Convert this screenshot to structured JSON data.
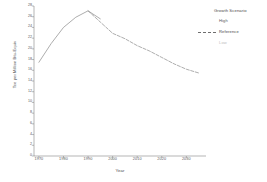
{
  "chart_data": {
    "type": "line",
    "title": "",
    "xlabel": "Year",
    "ylabel": "Tce per Million Btu-Equiv",
    "xlim": [
      1968,
      2038
    ],
    "ylim": [
      0,
      28
    ],
    "grid": false,
    "legend_position": "right",
    "legend_title": "Growth Scenario",
    "x_ticks": [
      1970,
      1980,
      1990,
      2000,
      2010,
      2020,
      2030
    ],
    "x_tick_labels": [
      "1970",
      "1980",
      "1990",
      "2000",
      "2010",
      "2020",
      "2030"
    ],
    "y_ticks": [
      0,
      2,
      4,
      6,
      8,
      10,
      12,
      14,
      16,
      18,
      20,
      22,
      24,
      26,
      28
    ],
    "y_tick_labels": [
      "0",
      "2",
      "4",
      "6",
      "8",
      "10",
      "12",
      "14",
      "16",
      "18",
      "20",
      "22",
      "24",
      "26",
      "28"
    ],
    "series": [
      {
        "name": "High",
        "style": "solid",
        "color": "#808080",
        "x": [
          1970,
          1975,
          1980,
          1985,
          1990,
          1995
        ],
        "values": [
          17.5,
          21.0,
          24.0,
          25.9,
          27.1,
          25.6
        ]
      },
      {
        "name": "Reference",
        "style": "dashed",
        "color": "#808080",
        "x": [
          1990,
          1995,
          2000,
          2005,
          2010,
          2015,
          2020,
          2025,
          2030,
          2035
        ],
        "values": [
          27.1,
          25.0,
          22.9,
          21.9,
          20.6,
          19.6,
          18.4,
          17.2,
          16.2,
          15.5
        ]
      },
      {
        "name": "Low",
        "style": "dotted",
        "color": "#c9c9c9",
        "x": [],
        "values": []
      }
    ]
  },
  "legend": {
    "title": "Growth Scenario",
    "entries": [
      {
        "label": "High",
        "color": "#5a5a5a",
        "sample": "none"
      },
      {
        "label": "Reference",
        "color": "#4a4a4a",
        "sample": "dashed"
      },
      {
        "label": "Low",
        "color": "#c0c0c0",
        "sample": "none"
      }
    ]
  },
  "axes": {
    "x_title": "Year",
    "y_title": "Tce per Million Btu-Equiv"
  },
  "colors": {
    "line": "#8a8a8a",
    "axis": "#6b6b6b",
    "text": "#555555",
    "background": "#ffffff"
  }
}
